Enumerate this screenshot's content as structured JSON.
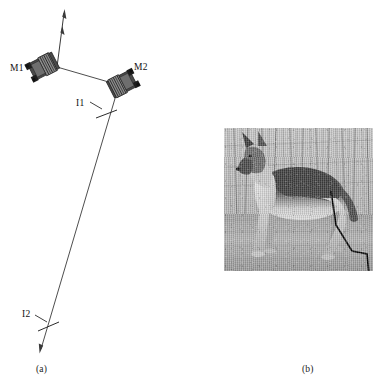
{
  "figure": {
    "panels": [
      {
        "id": "a",
        "caption": "(a)",
        "type": "optical-setup-diagram",
        "labels": [
          {
            "name": "M1",
            "text": "M1",
            "meaning": "mirror-1"
          },
          {
            "name": "M2",
            "text": "M2",
            "meaning": "mirror-2"
          },
          {
            "name": "I1",
            "text": "I1",
            "meaning": "image-plane-1"
          },
          {
            "name": "I2",
            "text": "I2",
            "meaning": "image-plane-2"
          }
        ],
        "components": [
          {
            "name": "mirror-mount-m1",
            "label": "M1",
            "x": 47,
            "y": 66,
            "rotation_deg": -28
          },
          {
            "name": "mirror-mount-m2",
            "label": "M2",
            "x": 119,
            "y": 84,
            "rotation_deg": -28
          }
        ],
        "beam_path": {
          "stroke": "#3a3a3a",
          "segments": [
            {
              "name": "incoming-beam",
              "from": [
                64,
                12
              ],
              "to": [
                57,
                66
              ],
              "arrow": "start"
            },
            {
              "name": "m1-to-m2-beam",
              "from": [
                57,
                66
              ],
              "to": [
                119,
                84
              ],
              "arrow": "none"
            },
            {
              "name": "m2-to-i2-beam",
              "from": [
                119,
                84
              ],
              "to": [
                40,
                352
              ],
              "arrow": "end"
            }
          ],
          "tick_markers": [
            {
              "name": "i1-tick",
              "x": 106,
              "y": 113,
              "length": 20,
              "angle_deg": 18
            },
            {
              "name": "i2-tick",
              "x": 47,
              "y": 325,
              "length": 20,
              "angle_deg": 18
            }
          ],
          "leader_lines": [
            {
              "name": "i1-leader",
              "from": [
                89,
                103
              ],
              "to": [
                101,
                110
              ]
            },
            {
              "name": "i2-leader",
              "from": [
                34,
                315
              ],
              "to": [
                45,
                322
              ]
            }
          ]
        }
      },
      {
        "id": "b",
        "caption": "(b)",
        "type": "photograph-with-overlay",
        "photo": {
          "name": "german-shepherd-photo",
          "subject": "German Shepherd dog standing in grass with bare trees behind",
          "palette": "grayscale",
          "x": 224,
          "y": 128,
          "width": 149,
          "height": 143
        },
        "overlay": {
          "name": "hind-leg-polyline",
          "stroke": "#000000",
          "stroke_width": 1.6,
          "points": [
            [
              107,
              63
            ],
            [
              112,
              97
            ],
            [
              128,
              123
            ],
            [
              143,
              126
            ],
            [
              145,
              146
            ]
          ]
        }
      }
    ]
  },
  "colors": {
    "ink": "#1a1a1a",
    "beam": "#3a3a3a",
    "overlay": "#000000",
    "page_background": "#ffffff"
  }
}
